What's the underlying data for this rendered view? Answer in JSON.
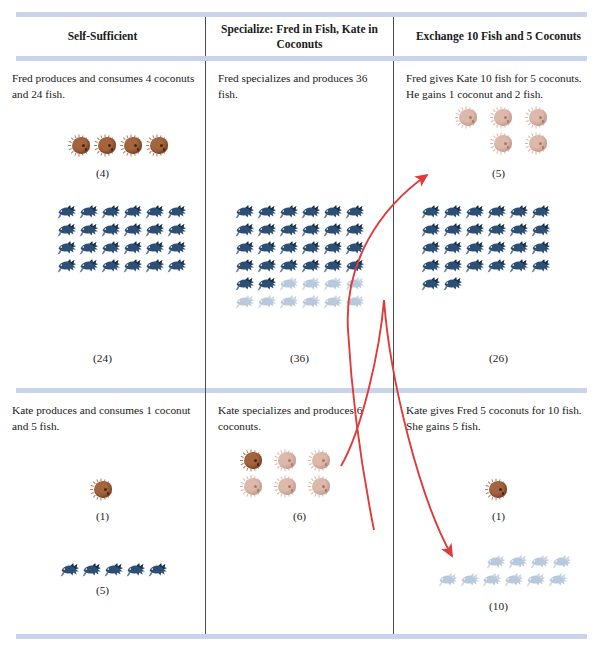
{
  "figure": {
    "columns": [
      {
        "header": "Self-Sufficient"
      },
      {
        "header": "Specialize: Fred in Fish,\nKate in Coconuts"
      },
      {
        "header": "Exchange 10 Fish and 5 Coconuts"
      }
    ],
    "rows": [
      {
        "person": "Fred",
        "cells": [
          {
            "caption": "Fred produces and consumes 4 coconuts and 24 fish.",
            "coconuts": {
              "count": 4,
              "label": "(4)",
              "pale_from": 4,
              "per_row": 4
            },
            "fish": {
              "count": 24,
              "label": "(24)",
              "pale_from": 24,
              "per_row": 6
            }
          },
          {
            "caption": "Fred specializes and produces 36 fish.",
            "coconuts": {
              "count": 0,
              "label": "",
              "pale_from": 0,
              "per_row": 6
            },
            "fish": {
              "count": 36,
              "label": "(36)",
              "pale_from": 26,
              "per_row": 6
            }
          },
          {
            "caption": "Fred gives Kate 10 fish for 5 coconuts. He gains 1 coconut and 2 fish.",
            "coconuts": {
              "count": 5,
              "label": "(5)",
              "pale_from": 0,
              "per_row": 3
            },
            "fish": {
              "count": 26,
              "label": "(26)",
              "pale_from": 26,
              "per_row": 6
            }
          }
        ]
      },
      {
        "person": "Kate",
        "cells": [
          {
            "caption": "Kate produces and consumes 1 coconut and 5 fish.",
            "coconuts": {
              "count": 1,
              "label": "(1)",
              "pale_from": 1,
              "per_row": 1
            },
            "fish": {
              "count": 5,
              "label": "(5)",
              "pale_from": 5,
              "per_row": 5
            }
          },
          {
            "caption": "Kate specializes and produces 6 coconuts.",
            "coconuts": {
              "count": 6,
              "label": "(6)",
              "pale_from": 1,
              "per_row": 3
            },
            "fish": {
              "count": 0,
              "label": "",
              "pale_from": 0,
              "per_row": 6
            }
          },
          {
            "caption": "Kate gives Fred 5 coconuts for 10 fish. She gains 5 fish.",
            "coconuts": {
              "count": 1,
              "label": "(1)",
              "pale_from": 1,
              "per_row": 1
            },
            "fish": {
              "count": 10,
              "label": "(10)",
              "pale_from": 0,
              "per_row": 6
            }
          }
        ]
      }
    ],
    "arrows": [
      {
        "name": "arrow-fish-to-fred-coconuts",
        "color": "#e03a3a"
      },
      {
        "name": "arrow-coconuts-to-kate-fish",
        "color": "#e03a3a"
      }
    ],
    "colors": {
      "rule_blue": "#bfcbe8",
      "divider": "#4b4b4b",
      "coconut_brown": "#a4643e",
      "coconut_pale": "#ddb9ab",
      "fish_blue": "#2c4f73",
      "fish_pale": "#b9c9dc",
      "arrow_red": "#e03a3a"
    }
  }
}
